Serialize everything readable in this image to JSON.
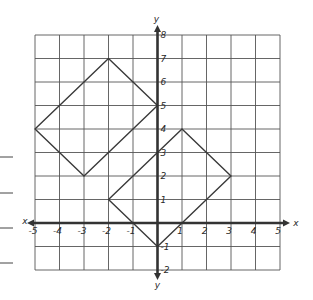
{
  "diagram": {
    "type": "coordinate-plane",
    "x_axis": {
      "label": "x",
      "min": -5,
      "max": 5,
      "ticks": [
        "-5",
        "-4",
        "-3",
        "-2",
        "-1",
        "1",
        "2",
        "3",
        "4",
        "5"
      ]
    },
    "y_axis": {
      "label": "y",
      "min": -2,
      "max": 8,
      "ticks": [
        "8",
        "7",
        "6",
        "5",
        "4",
        "3",
        "2",
        "1",
        "-1",
        "-2"
      ]
    },
    "shapes": [
      {
        "name": "large-square",
        "vertices": [
          [
            -5,
            4
          ],
          [
            -2,
            7
          ],
          [
            0,
            5
          ],
          [
            -3,
            2
          ]
        ]
      },
      {
        "name": "small-square",
        "vertices": [
          [
            1,
            4
          ],
          [
            3,
            2
          ],
          [
            0,
            -1
          ],
          [
            -2,
            1
          ]
        ]
      }
    ],
    "margin_lines": 4,
    "colors": {
      "grid": "#555555",
      "axis": "#333333",
      "shape": "#3a3a3a"
    }
  }
}
